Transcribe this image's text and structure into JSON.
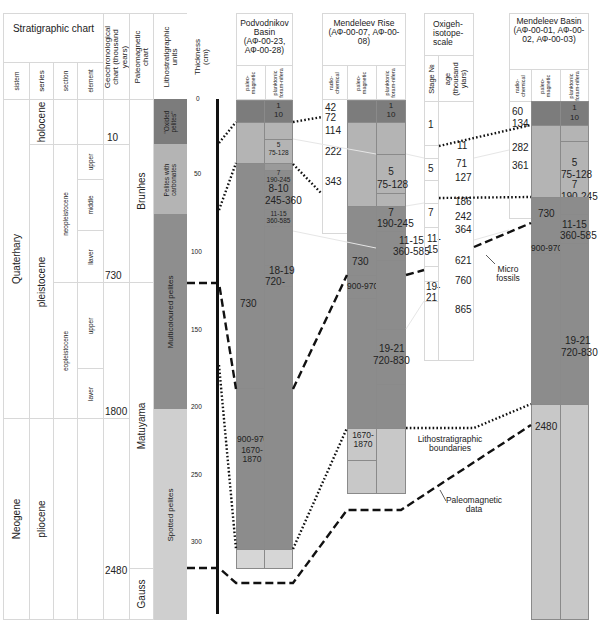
{
  "strat_chart": {
    "title": "Stratigraphic chart",
    "headers": {
      "sistem": "sistem",
      "series": "series",
      "section": "section",
      "element": "element",
      "geochron": "Geochronological chart (thousand years)",
      "paleomag": "Paleomagnetic chart",
      "litho": "Lithostratigraphic units",
      "thickness": "Thickness (cm)"
    },
    "systems": [
      "Quaterhary",
      "Neogene"
    ],
    "series": [
      "holocene",
      "pleistocene",
      "pliocene"
    ],
    "sections": [
      "neopleistocene",
      "eopleistocene"
    ],
    "elements": [
      "upper",
      "middle",
      "llaver",
      "upper",
      "laver"
    ],
    "geochron_values": [
      "10",
      "730",
      "1800",
      "2480"
    ],
    "paleomag_chrons": [
      "Brunhes",
      "Matuyama",
      "Gauss"
    ],
    "litho_units": [
      "\"Oxided pelites\"",
      "Pelites with carbonates",
      "Multicoloured pelites",
      "Spotted pelites"
    ],
    "thickness_ticks": [
      "0",
      "50",
      "100",
      "150",
      "200",
      "250",
      "300"
    ]
  },
  "podvodnikov": {
    "title": "Podvodnikov Basin (АФ-00-23, АФ-00-28)",
    "col_headers": [
      "paleo-magnetic",
      "planktonic foram-nifera"
    ],
    "paleomag_labels": [
      "730",
      "900-970",
      "1670-1870"
    ],
    "foram_labels": [
      {
        "stage": "1",
        "age": "10"
      },
      {
        "stage": "5",
        "age": "75-128"
      },
      {
        "stage": "7",
        "age": "190-245"
      },
      {
        "stage": "8-10",
        "age": "245-360"
      },
      {
        "stage": "11-15",
        "age": "360-585"
      },
      {
        "stage": "18-19",
        "age": "720-"
      }
    ]
  },
  "mendeleev_rise": {
    "title": "Mendeleev Rise (АФ-00-07, АФ-00-08)",
    "col_headers": [
      "radio-chemical",
      "paleo-magnetic",
      "planktonic foram-nifera"
    ],
    "radiochem": [
      "42",
      "72",
      "114",
      "222",
      "343"
    ],
    "paleomag_labels": [
      "730",
      "900-970",
      "1670-1870"
    ],
    "foram_labels": [
      {
        "stage": "1",
        "age": "10"
      },
      {
        "stage": "5",
        "age": "75-128"
      },
      {
        "stage": "7",
        "age": "190-245"
      },
      {
        "stage": "11-15",
        "age": "360-585"
      },
      {
        "stage": "19-21",
        "age": "720-830"
      }
    ]
  },
  "oxygen_scale": {
    "title": "Oxigeh-isotope-scale",
    "col_headers": [
      "Stage №",
      "age (thousand yiars)"
    ],
    "stages": [
      "1",
      "5",
      "7",
      "11-15",
      "19-21"
    ],
    "ages": [
      "11",
      "71",
      "127",
      "186",
      "242",
      "364",
      "621",
      "760",
      "865"
    ]
  },
  "mendeleev_basin": {
    "title": "Mendeleev Basin (АФ-00-01, АФ-00-02, АФ-00-03)",
    "col_headers": [
      "radio-chemical",
      "paleo-magnetic",
      "planktonic foram-nifera"
    ],
    "radiochem": [
      "60",
      "134",
      "282",
      "361"
    ],
    "paleomag_labels": [
      "730",
      "900-970",
      "2480"
    ],
    "foram_labels": [
      {
        "stage": "1",
        "age": "10"
      },
      {
        "stage": "5",
        "age": "75-128"
      },
      {
        "stage": "7",
        "age": "190-245"
      },
      {
        "stage": "11-15",
        "age": "360-585"
      },
      {
        "stage": "19-21",
        "age": "720-830"
      }
    ]
  },
  "annotations": {
    "micro": "Micro fossils",
    "litho_bound": "Lithostratigraphic boundaries",
    "paleo_data": "Paleomagnetic data"
  }
}
